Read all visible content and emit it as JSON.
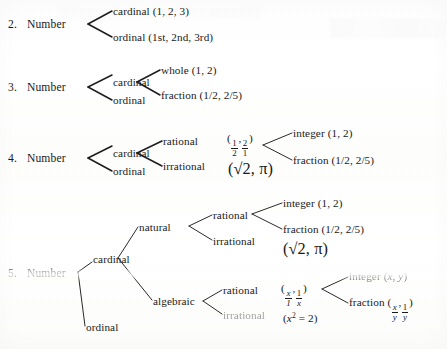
{
  "page": {
    "kind": "scanned-textbook-page"
  },
  "trees": [
    {
      "number": "2.",
      "root": "Number",
      "nodes": {
        "cardinal": "cardinal (1, 2, 3)",
        "ordinal": "ordinal (1st, 2nd, 3rd)"
      }
    },
    {
      "number": "3.",
      "root": "Number",
      "nodes": {
        "cardinal": "cardinal",
        "ordinal": "ordinal",
        "whole": "whole (1, 2)",
        "fraction": "fraction (1/2, 2/5)"
      }
    },
    {
      "number": "4.",
      "root": "Number",
      "nodes": {
        "cardinal": "cardinal",
        "ordinal": "ordinal",
        "rational": "rational",
        "irrational": "irrational",
        "rational_example_open": "(",
        "rational_example_n1": "1",
        "rational_example_d1": "2",
        "rational_example_sep": ",",
        "rational_example_n2": "2",
        "rational_example_d2": "1",
        "rational_example_close": ")",
        "irrational_example": "(√2, π)",
        "integer": "integer (1, 2)",
        "fraction": "fraction (1/2, 2/5)"
      }
    },
    {
      "number": "5.",
      "root": "Number",
      "nodes": {
        "cardinal": "cardinal",
        "ordinal": "ordinal",
        "natural": "natural",
        "algebraic": "algebraic",
        "natural_rational": "rational",
        "natural_irrational": "irrational",
        "natural_integer": "integer (1, 2)",
        "natural_fraction": "fraction (1/2, 2/5)",
        "natural_irrational_example": "(√2, π)",
        "algebraic_rational": "rational",
        "algebraic_irrational": "irrational",
        "algebraic_rational_open": "(",
        "algebraic_rational_n1": "x",
        "algebraic_rational_d1": "1",
        "algebraic_rational_sep": ",",
        "algebraic_rational_n2": "1",
        "algebraic_rational_d2": "x",
        "algebraic_rational_close": ")",
        "algebraic_irrational_example_open": "(",
        "algebraic_irrational_example_var": "x",
        "algebraic_irrational_example_exp": "2",
        "algebraic_irrational_example_eq": " = 2)",
        "algebraic_integer_label": "integer (",
        "algebraic_integer_x": "x",
        "algebraic_integer_sep": ", ",
        "algebraic_integer_y": "y",
        "algebraic_integer_close": ")",
        "algebraic_fraction_label": "fraction (",
        "algebraic_fraction_n1": "x",
        "algebraic_fraction_d1": "y",
        "algebraic_fraction_sep": ",",
        "algebraic_fraction_n2": "1",
        "algebraic_fraction_d2": "y",
        "algebraic_fraction_close": ")"
      }
    }
  ],
  "colors": {
    "ink": "#1a1a1a",
    "paper": "#ffffff"
  }
}
